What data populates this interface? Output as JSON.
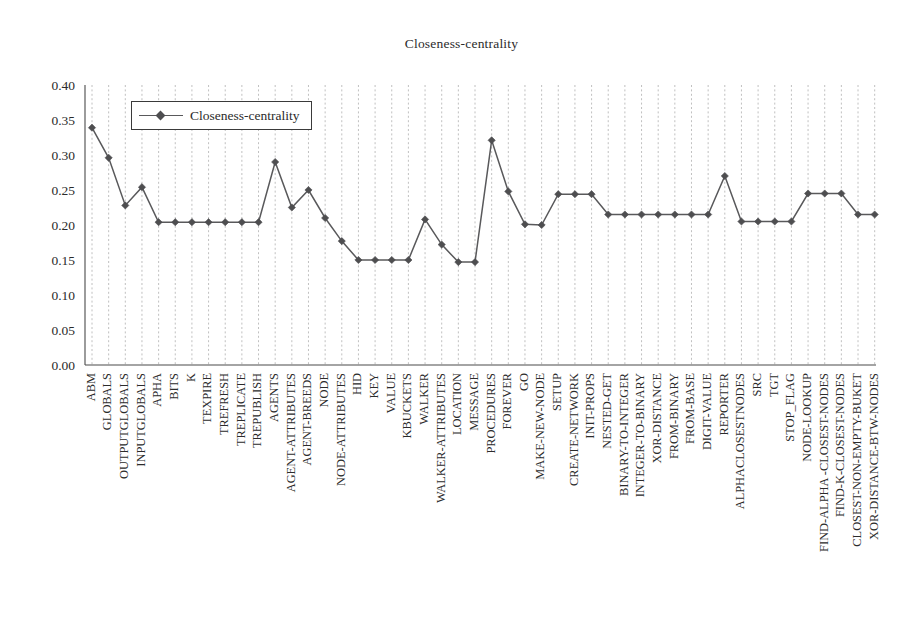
{
  "chart_data": {
    "type": "line",
    "title": "Closeness-centrality",
    "xlabel": "",
    "ylabel": "",
    "ylim": [
      0.0,
      0.4
    ],
    "yticks": [
      "0.00",
      "0.05",
      "0.10",
      "0.15",
      "0.20",
      "0.25",
      "0.30",
      "0.35",
      "0.40"
    ],
    "ytick_values": [
      0.0,
      0.05,
      0.1,
      0.15,
      0.2,
      0.25,
      0.3,
      0.35,
      0.4
    ],
    "grid": "vertical-dotted",
    "legend": {
      "position": "upper-left-inside",
      "entries": [
        "Closeness-centrality"
      ]
    },
    "categories": [
      "ABM",
      "GLOBALS",
      "OUTPUTGLOBALS",
      "INPUTGLOBALS",
      "APHA",
      "BITS",
      "K",
      "TEXPIRE",
      "TREFRESH",
      "TREPLICATE",
      "TREPUBLISH",
      "AGENTS",
      "AGENT-ATTRIBUTES",
      "AGENT-BREEDS",
      "NODE",
      "NODE-ATTRIBUTES",
      "HID",
      "KEY",
      "VALUE",
      "KBUCKETS",
      "WALKER",
      "WALKER-ATTRIBUTES",
      "LOCATION",
      "MESSAGE",
      "PROCEDURES",
      "FOREVER",
      "GO",
      "MAKE-NEW-NODE",
      "SETUP",
      "CREATE-NETWORK",
      "INIT-PROPS",
      "NESTED-GET",
      "BINARY-TO-INTEGER",
      "INTEGER-TO-BINARY",
      "XOR-DISTANCE",
      "FROM-BINARY",
      "FROM-BASE",
      "DIGIT-VALUE",
      "REPORTER",
      "ALPHACLOSESTNODES",
      "SRC",
      "TGT",
      "STOP_FLAG",
      "NODE-LOOKUP",
      "FIND-ALPHA -CLOSEST-NODES",
      "FIND-K-CLOSEST-NODES",
      "CLOSEST-NON-EMPTY-BUKET",
      "XOR-DISTANCE-BTW-NODES"
    ],
    "series": [
      {
        "name": "Closeness-centrality",
        "color": "#59595b",
        "marker": "diamond",
        "values": [
          0.339,
          0.296,
          0.228,
          0.254,
          0.204,
          0.204,
          0.204,
          0.204,
          0.204,
          0.204,
          0.204,
          0.29,
          0.225,
          0.25,
          0.21,
          0.177,
          0.15,
          0.15,
          0.15,
          0.15,
          0.208,
          0.172,
          0.147,
          0.147,
          0.321,
          0.248,
          0.201,
          0.2,
          0.244,
          0.244,
          0.244,
          0.215,
          0.215,
          0.215,
          0.215,
          0.215,
          0.215,
          0.215,
          0.27,
          0.205,
          0.205,
          0.205,
          0.205,
          0.245,
          0.245,
          0.245,
          0.215,
          0.215
        ]
      }
    ]
  },
  "legend": {
    "label": "Closeness-centrality"
  }
}
